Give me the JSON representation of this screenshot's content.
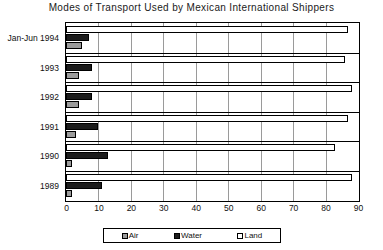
{
  "chart_data": {
    "type": "bar",
    "orientation": "horizontal",
    "title": "Modes of Transport Used by Mexican International Shippers",
    "xlabel": "",
    "ylabel": "",
    "xlim": [
      0,
      90
    ],
    "xticks": [
      0,
      10,
      20,
      30,
      40,
      50,
      60,
      70,
      80,
      90
    ],
    "grid": true,
    "legend_position": "bottom",
    "categories": [
      "Jan-Jun 1994",
      "1993",
      "1992",
      "1991",
      "1990",
      "1989"
    ],
    "series": [
      {
        "name": "Air",
        "color": "#9b9b9b",
        "values": [
          5,
          4,
          4,
          3,
          2,
          2
        ]
      },
      {
        "name": "Water",
        "color": "#1c1c1c",
        "values": [
          7,
          8,
          8,
          10,
          13,
          11
        ]
      },
      {
        "name": "Land",
        "color": "#ffffff",
        "values": [
          87,
          86,
          88,
          87,
          83,
          88
        ]
      }
    ]
  },
  "legend": {
    "items": [
      {
        "label": "Air"
      },
      {
        "label": "Water"
      },
      {
        "label": "Land"
      }
    ]
  }
}
